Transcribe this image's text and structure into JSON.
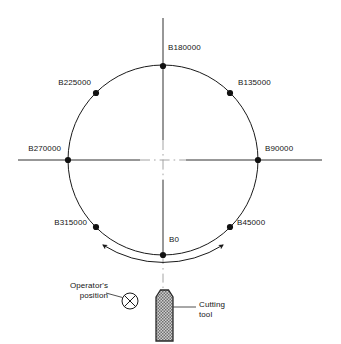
{
  "diagram": {
    "geometry": {
      "center_x": 163,
      "center_y": 160,
      "radius": 95,
      "sweep_arc_radius": 112
    },
    "colors": {
      "line": "#1a1a1a",
      "centerline": "#8e8e8e",
      "text": "#151515",
      "tool_fill": "#b9b9b9",
      "tool_outline": "#2a2a2a",
      "leader": "#555555"
    },
    "positions": [
      {
        "id": "b0",
        "label": "B0",
        "angle_deg": 0,
        "point_x": 163,
        "point_y": 255,
        "label_x": 168,
        "label_y": 238,
        "align": "left"
      },
      {
        "id": "b45000",
        "label": "B45000",
        "angle_deg": 45,
        "point_x": 230,
        "point_y": 227,
        "label_x": 237,
        "label_y": 222,
        "align": "left"
      },
      {
        "id": "b90000",
        "label": "B90000",
        "angle_deg": 90,
        "point_x": 258,
        "point_y": 160,
        "label_x": 265,
        "label_y": 149,
        "align": "left"
      },
      {
        "id": "b135000",
        "label": "B135000",
        "angle_deg": 135,
        "point_x": 230,
        "point_y": 93,
        "label_x": 238,
        "label_y": 84,
        "align": "left"
      },
      {
        "id": "b180000",
        "label": "B180000",
        "angle_deg": 180,
        "point_x": 163,
        "point_y": 66,
        "label_x": 170,
        "label_y": 53,
        "align": "left"
      },
      {
        "id": "b225000",
        "label": "B225000",
        "angle_deg": 225,
        "point_x": 96,
        "point_y": 93,
        "label_x": 91,
        "label_y": 84,
        "align": "right"
      },
      {
        "id": "b270000",
        "label": "B270000",
        "angle_deg": 270,
        "point_x": 68,
        "point_y": 160,
        "label_x": 62,
        "label_y": 149,
        "align": "right"
      },
      {
        "id": "b315000",
        "label": "B315000",
        "angle_deg": 315,
        "point_x": 96,
        "point_y": 227,
        "label_x": 90,
        "label_y": 222,
        "align": "right"
      }
    ],
    "annotations": {
      "operator": {
        "line1": "Operator's",
        "line2": "position",
        "label_x": 114,
        "label_y": 281,
        "symbol": "crossed-circle",
        "symbol_x": 130,
        "symbol_y": 301,
        "symbol_r": 8
      },
      "cutting_tool": {
        "line1": "Cutting",
        "line2": "tool",
        "label_x": 199,
        "label_y": 300
      }
    }
  }
}
